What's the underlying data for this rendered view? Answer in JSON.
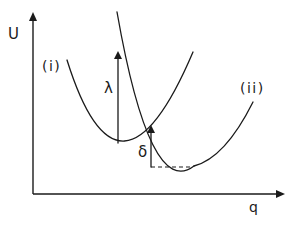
{
  "diagram": {
    "type": "potential-energy-curves",
    "axes": {
      "y_label": "U",
      "x_label": "q"
    },
    "curves": [
      {
        "label": "(i)",
        "description": "initial state parabola, minimum left"
      },
      {
        "label": "(ii)",
        "description": "final state parabola, minimum right and lower"
      }
    ],
    "annotations": {
      "lambda": "λ",
      "delta": "δ"
    },
    "colors": {
      "ink": "#1a1a1a",
      "background": "#ffffff"
    }
  }
}
